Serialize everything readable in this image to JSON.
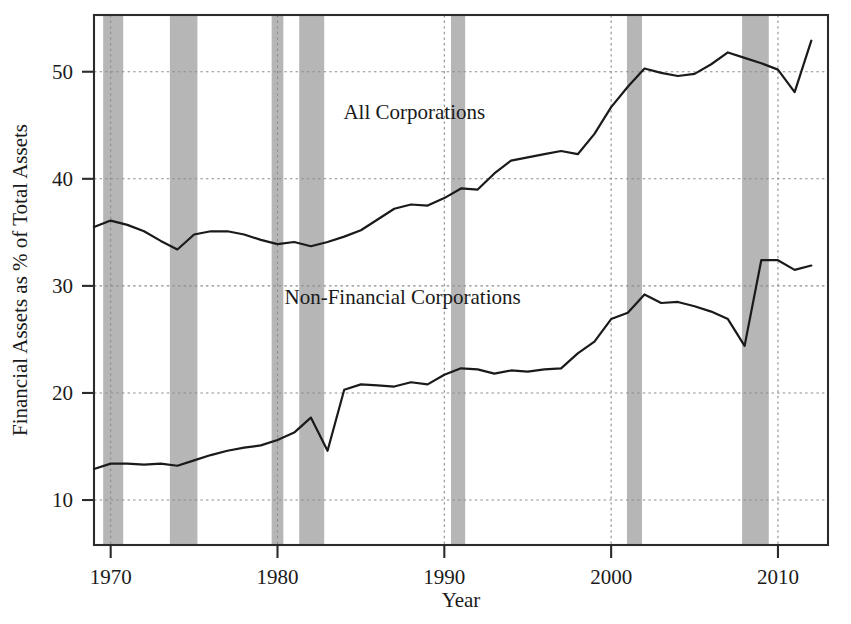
{
  "chart_data": {
    "type": "line",
    "title": "",
    "xlabel": "Year",
    "ylabel": "Financial Assets as % of Total Assets",
    "xlim": [
      1969,
      2013
    ],
    "ylim": [
      5.8,
      55.3
    ],
    "xticks": [
      1970,
      1980,
      1990,
      2000,
      2010
    ],
    "xtick_labels": [
      "1970",
      "1980",
      "1990",
      "2000",
      "2010"
    ],
    "yticks": [
      10,
      20,
      30,
      40,
      50
    ],
    "ytick_labels": [
      "10",
      "20",
      "30",
      "40",
      "50"
    ],
    "grid": "horizontal-and-vertical-dotted",
    "legend": "inline-annotations",
    "x": [
      1969,
      1970,
      1971,
      1972,
      1973,
      1974,
      1975,
      1976,
      1977,
      1978,
      1979,
      1980,
      1981,
      1982,
      1983,
      1984,
      1985,
      1986,
      1987,
      1988,
      1989,
      1990,
      1991,
      1992,
      1993,
      1994,
      1995,
      1996,
      1997,
      1998,
      1999,
      2000,
      2001,
      2002,
      2003,
      2004,
      2005,
      2006,
      2007,
      2008,
      2009,
      2010,
      2011,
      2012
    ],
    "series": [
      {
        "name": "All Corporations",
        "label_x": 1988.2,
        "label_y": 45.6,
        "values": [
          35.5,
          36.1,
          35.7,
          35.1,
          34.2,
          33.4,
          34.8,
          35.1,
          35.1,
          34.8,
          34.3,
          33.9,
          34.1,
          33.7,
          34.1,
          34.6,
          35.2,
          36.2,
          37.2,
          37.6,
          37.5,
          38.2,
          39.1,
          39.0,
          40.5,
          41.7,
          42.0,
          42.3,
          42.6,
          42.3,
          44.2,
          46.7,
          48.6,
          50.3,
          49.9,
          49.6,
          49.8,
          50.7,
          51.8,
          51.3,
          50.8,
          50.2,
          48.1,
          52.9
        ]
      },
      {
        "name": "Non-Financial Corporations",
        "label_x": 1987.5,
        "label_y": 28.3,
        "values": [
          12.9,
          13.4,
          13.4,
          13.3,
          13.4,
          13.2,
          13.7,
          14.2,
          14.6,
          14.9,
          15.1,
          15.6,
          16.3,
          17.7,
          14.6,
          20.3,
          20.8,
          20.7,
          20.6,
          21.0,
          20.8,
          21.7,
          22.3,
          22.2,
          21.8,
          22.1,
          22.0,
          22.2,
          22.3,
          23.7,
          24.8,
          26.9,
          27.5,
          29.2,
          28.4,
          28.5,
          28.1,
          27.6,
          26.9,
          24.4,
          32.4,
          32.4,
          31.5,
          31.9
        ]
      }
    ],
    "recession_bands": [
      {
        "start": 1969.55,
        "end": 1970.75
      },
      {
        "start": 1973.55,
        "end": 1975.2
      },
      {
        "start": 1979.65,
        "end": 1980.35
      },
      {
        "start": 1981.3,
        "end": 1982.8
      },
      {
        "start": 1990.4,
        "end": 1991.25
      },
      {
        "start": 2000.95,
        "end": 2001.85
      },
      {
        "start": 2007.85,
        "end": 2009.45
      }
    ]
  },
  "colors": {
    "line": "#1a1a1a",
    "recession": "#a6a6a6",
    "grid": "#8c8c8c",
    "axis": "#2b2b2b",
    "background": "#ffffff"
  }
}
